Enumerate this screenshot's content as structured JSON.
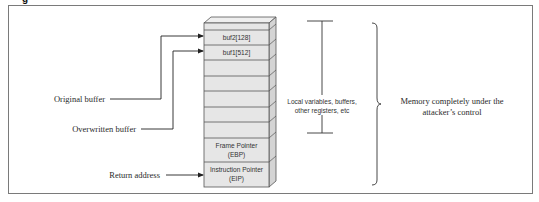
{
  "figure": {
    "heading_fragment": "g",
    "frame_color": "#777777"
  },
  "stack": {
    "face_color": "#e6e6e6",
    "side_color": "#d2d2d2",
    "top_color": "#eeeeee",
    "edge_color": "#555555",
    "cells": [
      {
        "line1": "buf2[128]",
        "line2": ""
      },
      {
        "line1": "buf1[512]",
        "line2": ""
      },
      {
        "line1": "",
        "line2": ""
      },
      {
        "line1": "",
        "line2": ""
      },
      {
        "line1": "",
        "line2": ""
      },
      {
        "line1": "",
        "line2": ""
      },
      {
        "line1": "",
        "line2": ""
      },
      {
        "line1": "Frame Pointer",
        "line2": "(EBP)"
      },
      {
        "line1": "Instruction Pointer",
        "line2": "(EIP)"
      }
    ]
  },
  "left_labels": {
    "original_buffer": "Original buffer",
    "overwritten_buffer": "Overwritten buffer",
    "return_address": "Return address"
  },
  "range_bracket": {
    "line1": "Local variables, buffers,",
    "line2": "other registers, etc"
  },
  "curly_brace": {
    "line1": "Memory completely under the",
    "line2": "attacker’s control"
  }
}
